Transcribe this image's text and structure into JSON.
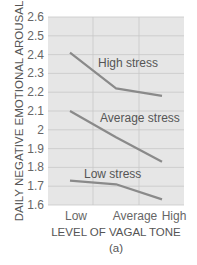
{
  "chart_data": {
    "type": "line",
    "title": "",
    "caption": "(a)",
    "xlabel": "LEVEL OF VAGAL TONE",
    "ylabel": "DAILY NEGATIVE EMOTIONAL AROUSAL",
    "categories": [
      "Low",
      "Average",
      "High"
    ],
    "ylim": [
      1.6,
      2.6
    ],
    "yticks": [
      "2.6",
      "2.5",
      "2.4",
      "2.3",
      "2.2",
      "2.1",
      "2",
      "1.9",
      "1.8",
      "1.7",
      "1.6"
    ],
    "grid": true,
    "legend": "inline labels",
    "series": [
      {
        "name": "High stress",
        "values": [
          2.41,
          2.22,
          2.18
        ]
      },
      {
        "name": "Average stress",
        "values": [
          2.1,
          1.96,
          1.83
        ]
      },
      {
        "name": "Low stress",
        "values": [
          1.73,
          1.71,
          1.63
        ]
      }
    ],
    "colors": {
      "plot_background": "#e6e6e6",
      "gridline": "#c8c8c8",
      "line": "#8a8a8a",
      "text": "#555555"
    }
  }
}
